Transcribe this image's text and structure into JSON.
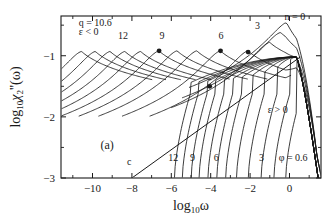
{
  "figure": {
    "panel_label": "(a)",
    "background": "#ffffff",
    "line_color": "#1a1a1a"
  },
  "chart_data": {
    "type": "line",
    "title": "",
    "subtitle": "",
    "xlabel": "log10ω",
    "ylabel": "log10χ₂''(ω)",
    "xlabel_parts": {
      "base": "log",
      "sub": "10",
      "var": "ω"
    },
    "ylabel_parts": {
      "base": "log",
      "sub": "10",
      "var": "χ",
      "var_sub": "2",
      "primes": "''",
      "arg": "(ω)"
    },
    "xlim": [
      -11.6,
      1.6
    ],
    "ylim": [
      -3.0,
      -0.35
    ],
    "xticks": [
      -10,
      -8,
      -6,
      -4,
      -2,
      0
    ],
    "xtick_labels": [
      "−10",
      "−8",
      "−6",
      "−4",
      "−2",
      "0"
    ],
    "xticks_minor": [
      -11,
      -9,
      -7,
      -5,
      -3,
      -1,
      1
    ],
    "yticks": [
      -1,
      -2,
      -3
    ],
    "ytick_labels": [
      "−1",
      "−2",
      "−3"
    ],
    "grid": false,
    "legend": "none",
    "annotations": [
      {
        "id": "q-value",
        "text": "q = 10.6",
        "x": -10.7,
        "y": -0.52
      },
      {
        "id": "epsilon-negative",
        "text": "ε < 0",
        "x": -10.7,
        "y": -0.66
      },
      {
        "id": "epsilon-positive",
        "text": "ε > 0",
        "x": -1.1,
        "y": -1.93
      },
      {
        "id": "panel-label",
        "text": "(a)",
        "x": -9.6,
        "y": -2.52
      },
      {
        "id": "n-zero-label",
        "text": "n = 0",
        "x": -0.25,
        "y": -0.42
      },
      {
        "id": "top-label-12",
        "text": "12",
        "x": -8.7,
        "y": -0.72
      },
      {
        "id": "top-label-9",
        "text": "9",
        "x": -6.6,
        "y": -0.72
      },
      {
        "id": "top-label-6",
        "text": "6",
        "x": -3.6,
        "y": -0.72
      },
      {
        "id": "top-label-3",
        "text": "3",
        "x": -1.75,
        "y": -0.56
      },
      {
        "id": "bottom-label-c",
        "text": "c",
        "x": -8.25,
        "y": -2.78
      },
      {
        "id": "bottom-label-12",
        "text": "12",
        "x": -6.15,
        "y": -2.72
      },
      {
        "id": "bottom-label-9",
        "text": "9",
        "x": -5.05,
        "y": -2.72
      },
      {
        "id": "bottom-label-6",
        "text": "6",
        "x": -3.85,
        "y": -2.72
      },
      {
        "id": "bottom-label-3",
        "text": "3",
        "x": -1.55,
        "y": -2.72
      },
      {
        "id": "phi-value",
        "text": "φ = 0.6",
        "x": -0.55,
        "y": -2.72
      }
    ],
    "markers": [
      {
        "id": "marker-9",
        "x": -6.62,
        "y": -0.92
      },
      {
        "id": "marker-6",
        "x": -3.5,
        "y": -0.92
      },
      {
        "id": "marker-3",
        "x": -2.1,
        "y": -0.94
      },
      {
        "id": "marker-low",
        "x": -4.05,
        "y": -1.5
      }
    ],
    "series": [
      {
        "name": "critical-line-c",
        "kind": "straight",
        "x0": -8.0,
        "y0": -3.0,
        "x1": 0.55,
        "y1": -1.02
      },
      {
        "name": "epsilon-negative-n12",
        "kind": "peak",
        "peak_x": -10.55,
        "peak_y": -0.93
      },
      {
        "name": "epsilon-negative-n11",
        "kind": "peak",
        "peak_x": -9.85,
        "peak_y": -0.93
      },
      {
        "name": "epsilon-negative-n10",
        "kind": "peak",
        "peak_x": -9.1,
        "peak_y": -0.93
      },
      {
        "name": "epsilon-negative-n9",
        "kind": "peak",
        "peak_x": -8.35,
        "peak_y": -0.93
      },
      {
        "name": "epsilon-negative-n8",
        "kind": "peak",
        "peak_x": -7.55,
        "peak_y": -0.93
      },
      {
        "name": "epsilon-negative-n7",
        "kind": "peak",
        "peak_x": -6.62,
        "peak_y": -0.92
      },
      {
        "name": "epsilon-negative-n6",
        "kind": "peak",
        "peak_x": -5.7,
        "peak_y": -0.92
      },
      {
        "name": "epsilon-negative-n5",
        "kind": "peak",
        "peak_x": -4.7,
        "peak_y": -0.92
      },
      {
        "name": "epsilon-negative-n4",
        "kind": "peak",
        "peak_x": -3.5,
        "peak_y": -0.92
      },
      {
        "name": "epsilon-negative-n3",
        "kind": "peak",
        "peak_x": -2.1,
        "peak_y": -0.92
      },
      {
        "name": "epsilon-negative-n2",
        "kind": "peak",
        "peak_x": -1.0,
        "peak_y": -0.78
      },
      {
        "name": "epsilon-negative-n1",
        "kind": "peak",
        "peak_x": -0.45,
        "peak_y": -0.62
      },
      {
        "name": "epsilon-negative-n0",
        "kind": "peak",
        "peak_x": -0.1,
        "peak_y": -0.45
      },
      {
        "name": "epsilon-positive-n12",
        "kind": "rise",
        "onset_x": -5.85
      },
      {
        "name": "epsilon-positive-n11",
        "kind": "rise",
        "onset_x": -5.45
      },
      {
        "name": "epsilon-positive-n10",
        "kind": "rise",
        "onset_x": -5.0
      },
      {
        "name": "epsilon-positive-n9",
        "kind": "rise",
        "onset_x": -4.6
      },
      {
        "name": "epsilon-positive-n8",
        "kind": "rise",
        "onset_x": -4.15
      },
      {
        "name": "epsilon-positive-n7",
        "kind": "rise",
        "onset_x": -3.7
      },
      {
        "name": "epsilon-positive-n6",
        "kind": "rise",
        "onset_x": -3.25
      },
      {
        "name": "epsilon-positive-n5",
        "kind": "rise",
        "onset_x": -2.7
      },
      {
        "name": "epsilon-positive-n4",
        "kind": "rise",
        "onset_x": -2.1
      },
      {
        "name": "epsilon-positive-n3",
        "kind": "rise",
        "onset_x": -1.45
      },
      {
        "name": "epsilon-positive-n2",
        "kind": "rise",
        "onset_x": -0.8
      },
      {
        "name": "epsilon-positive-n1",
        "kind": "rise",
        "onset_x": -0.2
      }
    ]
  }
}
